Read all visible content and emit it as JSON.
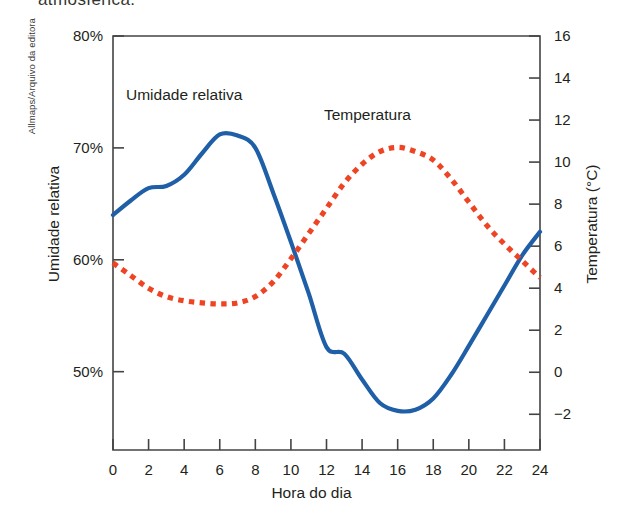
{
  "credit": "Allmaps/Arquivo da editora",
  "cutoff_heading": "atmosférica.",
  "chart_data": {
    "type": "line",
    "title": "",
    "xlabel": "Hora do dia",
    "ylabel": "Umidade relativa",
    "ylabel_right": "Temperatura (°C)",
    "x": [
      0,
      1,
      2,
      3,
      4,
      5,
      6,
      7,
      8,
      9,
      10,
      11,
      12,
      13,
      14,
      15,
      16,
      17,
      18,
      19,
      20,
      21,
      22,
      23,
      24
    ],
    "xlim": [
      0,
      24
    ],
    "xticks": [
      "0",
      "2",
      "4",
      "6",
      "8",
      "10",
      "12",
      "14",
      "16",
      "18",
      "20",
      "22",
      "24"
    ],
    "xtick_values": [
      0,
      2,
      4,
      6,
      8,
      10,
      12,
      14,
      16,
      18,
      20,
      22,
      24
    ],
    "ylim_left": [
      43.0,
      80.0
    ],
    "yticks_left": [
      "80%",
      "70%",
      "60%",
      "50%"
    ],
    "ytick_left_values": [
      80,
      70,
      60,
      50
    ],
    "ylim_right": [
      -3.7,
      16.0
    ],
    "yticks_right": [
      "16",
      "14",
      "12",
      "10",
      "8",
      "6",
      "4",
      "2",
      "0",
      "-2"
    ],
    "ytick_right_values": [
      16,
      14,
      12,
      10,
      8,
      6,
      4,
      2,
      0,
      -2
    ],
    "grid": false,
    "legend": "in-plot labels",
    "series": [
      {
        "name": "Umidade relativa",
        "axis": "left",
        "unit": "%",
        "color": "#1f5fa8",
        "style": "solid",
        "label_x": 4.0,
        "label_y": 74.6,
        "values": [
          64.0,
          65.3,
          66.4,
          66.6,
          67.6,
          69.5,
          71.2,
          71.1,
          70.0,
          66.0,
          61.6,
          57.0,
          52.2,
          51.6,
          49.3,
          47.2,
          46.5,
          46.6,
          47.6,
          49.7,
          52.3,
          55.0,
          57.7,
          60.4,
          62.5
        ]
      },
      {
        "name": "Temperatura",
        "axis": "right",
        "unit": "°C",
        "color": "#ef4423",
        "style": "dotted",
        "label_x": 14.3,
        "label_y_right": 12.2,
        "values": [
          5.2,
          4.6,
          4.0,
          3.6,
          3.4,
          3.3,
          3.25,
          3.3,
          3.6,
          4.3,
          5.4,
          6.6,
          7.8,
          9.0,
          9.9,
          10.5,
          10.7,
          10.5,
          10.1,
          9.2,
          8.1,
          7.0,
          6.1,
          5.3,
          4.5
        ]
      }
    ]
  }
}
